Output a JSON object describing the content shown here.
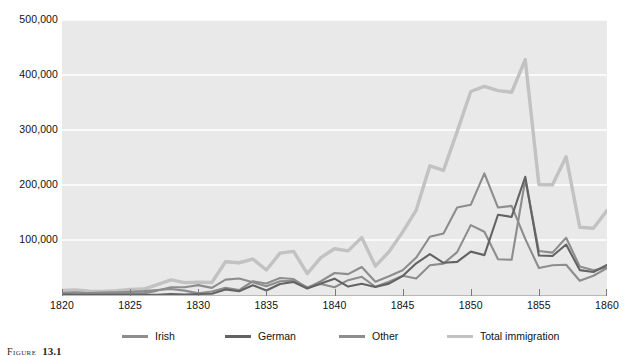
{
  "caption": {
    "label": "Figure",
    "number": "13.1"
  },
  "chart_data": {
    "type": "line",
    "title": "",
    "subtitle": "",
    "xlabel": "",
    "ylabel": "",
    "xlim": [
      1820,
      1860
    ],
    "ylim": [
      0,
      500000
    ],
    "grid": true,
    "grid_axis": "y",
    "legend_position": "bottom",
    "plot_background": "#e9e9e9",
    "gridline_color": "#ffffff",
    "x_tick_labels": [
      "1820",
      "1825",
      "1830",
      "1835",
      "1840",
      "1845",
      "1850",
      "1855",
      "1860"
    ],
    "x_tick_values": [
      1820,
      1825,
      1830,
      1835,
      1840,
      1845,
      1850,
      1855,
      1860
    ],
    "y_tick_labels": [
      "100,000",
      "200,000",
      "300,000",
      "400,000",
      "500,000"
    ],
    "y_tick_values": [
      100000,
      200000,
      300000,
      400000,
      500000
    ],
    "x": [
      1820,
      1821,
      1822,
      1823,
      1824,
      1825,
      1826,
      1827,
      1828,
      1829,
      1830,
      1831,
      1832,
      1833,
      1834,
      1835,
      1836,
      1837,
      1838,
      1839,
      1840,
      1841,
      1842,
      1843,
      1844,
      1845,
      1846,
      1847,
      1848,
      1849,
      1850,
      1851,
      1852,
      1853,
      1854,
      1855,
      1856,
      1857,
      1858,
      1859,
      1860
    ],
    "series": [
      {
        "name": "Irish",
        "color": "#8d8d8d",
        "values": [
          4000,
          3000,
          3500,
          4500,
          5000,
          6000,
          7000,
          9000,
          11000,
          8000,
          3000,
          6500,
          13000,
          9000,
          25000,
          21000,
          31000,
          29000,
          13000,
          25000,
          40000,
          38000,
          51000,
          24000,
          34000,
          45000,
          68000,
          106000,
          112000,
          159000,
          164000,
          221000,
          159000,
          162000,
          102000,
          49000,
          54000,
          55000,
          26000,
          35000,
          49000
        ]
      },
      {
        "name": "German",
        "color": "#636363",
        "values": [
          1000,
          400,
          150,
          200,
          200,
          450,
          500,
          430,
          1850,
          600,
          1900,
          2400,
          10200,
          6900,
          17700,
          8300,
          20100,
          23700,
          11700,
          21000,
          29700,
          15300,
          20400,
          14400,
          20700,
          34400,
          57600,
          74300,
          58500,
          60200,
          78900,
          72500,
          145900,
          141900,
          215000,
          71900,
          71000,
          91800,
          45300,
          41800,
          54500
        ]
      },
      {
        "name": "Other",
        "color": "#8d8d8d",
        "values": [
          3500,
          5000,
          3000,
          2500,
          2500,
          3500,
          3000,
          8000,
          14000,
          14000,
          18000,
          13000,
          28000,
          30000,
          23000,
          16000,
          25000,
          26000,
          14000,
          20000,
          14000,
          27000,
          33000,
          15000,
          24000,
          35000,
          30000,
          54000,
          57000,
          78000,
          127000,
          115000,
          65000,
          64000,
          210000,
          80000,
          77000,
          104000,
          52000,
          45000,
          50000
        ]
      },
      {
        "name": "Total immigration",
        "color": "#c2c2c2",
        "values": [
          8385,
          9127,
          6911,
          6354,
          7912,
          10199,
          10837,
          18875,
          27382,
          22520,
          23322,
          22633,
          60482,
          58640,
          65365,
          45374,
          76242,
          79340,
          38914,
          68069,
          84066,
          80289,
          104565,
          52496,
          78615,
          114371,
          154416,
          234968,
          226527,
          297024,
          369980,
          379466,
          371603,
          368645,
          427833,
          200877,
          200436,
          251306,
          123126,
          121282,
          153640
        ]
      }
    ]
  },
  "legend": {
    "items": [
      {
        "label": "Irish",
        "color": "#8d8d8d"
      },
      {
        "label": "German",
        "color": "#636363"
      },
      {
        "label": "Other",
        "color": "#8d8d8d"
      },
      {
        "label": "Total immigration",
        "color": "#c2c2c2"
      }
    ]
  }
}
